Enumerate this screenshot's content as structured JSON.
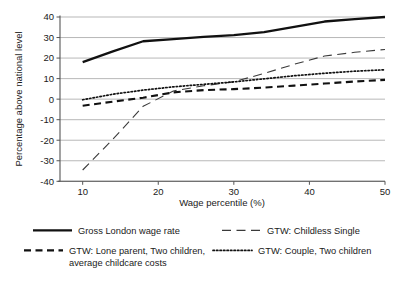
{
  "chart_data": {
    "type": "line",
    "title": "",
    "xlabel": "Wage percentile (%)",
    "ylabel": "Percentage above national level",
    "xlim": [
      7,
      50
    ],
    "ylim": [
      -40,
      40
    ],
    "xticks": [
      10,
      20,
      30,
      40,
      50
    ],
    "yticks": [
      -40,
      -30,
      -20,
      -10,
      0,
      10,
      20,
      30,
      40
    ],
    "xtick_labels": [
      "10",
      "20",
      "30",
      "40",
      "50"
    ],
    "ytick_labels": [
      "-40",
      "-30",
      "-20",
      "-10",
      "0",
      "10",
      "20",
      "30",
      "40"
    ],
    "grid": true,
    "grid_axis": "y",
    "legend_position": "below",
    "legend_columns": 2,
    "series": [
      {
        "name": "Gross London wage rate",
        "style": "solid",
        "color": "#111111",
        "width": 2.3,
        "x": [
          10,
          14,
          18,
          22,
          26,
          30,
          34,
          38,
          42,
          46,
          50
        ],
        "values": [
          18.0,
          23.3,
          28.2,
          29.2,
          30.3,
          31.2,
          32.6,
          35.2,
          37.8,
          39.0,
          40.0
        ]
      },
      {
        "name": "GTW: Childless Single",
        "style": "longdash",
        "color": "#3a3a3a",
        "width": 1.1,
        "x": [
          10,
          14,
          18,
          22,
          26,
          30,
          34,
          38,
          42,
          46,
          50
        ],
        "values": [
          -34.5,
          -19.5,
          -3.5,
          4.0,
          6.5,
          8.5,
          12.5,
          17.0,
          21.0,
          22.8,
          24.2
        ]
      },
      {
        "name": "GTW: Lone parent, Two children, average childcare costs",
        "style": "dashed",
        "color": "#111111",
        "width": 2.1,
        "x": [
          10,
          14,
          18,
          22,
          26,
          30,
          34,
          38,
          42,
          46,
          50
        ],
        "values": [
          -3.2,
          -1.2,
          0.7,
          3.3,
          4.4,
          4.9,
          5.6,
          6.6,
          7.6,
          8.6,
          9.4
        ]
      },
      {
        "name": "GTW: Couple, Two children",
        "style": "dotted",
        "color": "#111111",
        "width": 1.7,
        "x": [
          10,
          14,
          18,
          22,
          26,
          30,
          34,
          38,
          42,
          46,
          50
        ],
        "values": [
          -0.3,
          2.4,
          4.4,
          6.0,
          7.2,
          8.4,
          9.9,
          11.4,
          12.6,
          13.6,
          14.3
        ]
      }
    ]
  },
  "axes": {
    "x_title": "Wage percentile (%)",
    "y_title": "Percentage above national level"
  },
  "legend": {
    "entries": [
      {
        "label": "Gross London wage rate",
        "style": "solid"
      },
      {
        "label": "GTW: Childless Single",
        "style": "longdash"
      },
      {
        "label": "GTW: Lone parent, Two children,",
        "label2": "average childcare costs",
        "style": "dashed"
      },
      {
        "label": "GTW: Couple, Two children",
        "style": "dotted"
      }
    ]
  }
}
